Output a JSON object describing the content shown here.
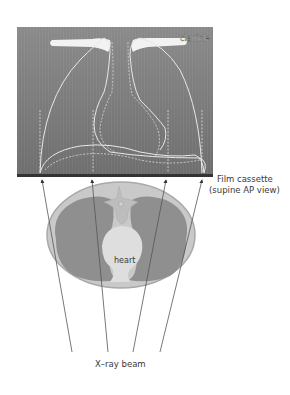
{
  "diagram": {
    "labels": {
      "clavicle": "clavicle",
      "film_line1": "Film cassette",
      "film_line2": "(supine AP view)",
      "heart": "heart",
      "beam": "X–ray beam"
    },
    "colors": {
      "film_bg": "#7a7a7a",
      "film_line": "#e8e8e8",
      "body_outer": "#c9c9c9",
      "body_rim": "#a9a9a9",
      "lung": "#8f8f8f",
      "heart": "#dedede",
      "spine": "#bdbdbd",
      "arrow": "#555555",
      "text": "#3a3a3a"
    },
    "arrows": [
      {
        "from": [
          72,
          352
        ],
        "to": [
          42,
          179
        ]
      },
      {
        "from": [
          108,
          352
        ],
        "to": [
          92,
          179
        ]
      },
      {
        "from": [
          133,
          352
        ],
        "to": [
          166,
          179
        ]
      },
      {
        "from": [
          160,
          352
        ],
        "to": [
          202,
          179
        ]
      }
    ]
  }
}
